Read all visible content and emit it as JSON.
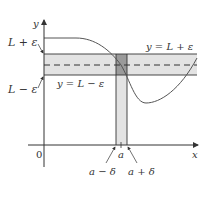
{
  "diagram": {
    "axes": {
      "x_label": "x",
      "y_label": "y",
      "origin_label": "0"
    },
    "horizontal_band": {
      "upper_label": "L + ε",
      "lower_label": "L − ε",
      "upper_line_label": "y = L + ε",
      "lower_line_label": "y = L − ε",
      "center_line": "y = L (dashed)"
    },
    "vertical_strip": {
      "center_label": "a",
      "left_label": "a − δ",
      "right_label": "a + δ"
    },
    "colors": {
      "band_fill": "#e3e3e3",
      "intersection_fill": "#9a9a9a",
      "lines": "#333333",
      "curve": "#555555"
    }
  }
}
